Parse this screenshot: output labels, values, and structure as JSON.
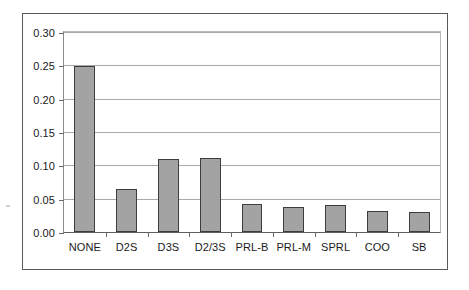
{
  "chart_data": {
    "type": "bar",
    "title": "",
    "subtitle": "",
    "xlabel": "",
    "ylabel": "",
    "categories": [
      "NONE",
      "D2S",
      "D3S",
      "D2/3S",
      "PRL-B",
      "PRL-M",
      "SPRL",
      "COO",
      "SB"
    ],
    "values": [
      0.249,
      0.065,
      0.109,
      0.111,
      0.042,
      0.037,
      0.041,
      0.032,
      0.03
    ],
    "series": [
      {
        "name": "",
        "values": [
          0.249,
          0.065,
          0.109,
          0.111,
          0.042,
          0.037,
          0.041,
          0.032,
          0.03
        ]
      }
    ],
    "ylim": [
      0.0,
      0.3
    ],
    "ytick_values": [
      0.0,
      0.05,
      0.1,
      0.15,
      0.2,
      0.25,
      0.3
    ],
    "ytick_labels": [
      "0.00",
      "0.05",
      "0.10",
      "0.15",
      "0.20",
      "0.25",
      "0.30"
    ],
    "grid": true,
    "grid_axis": "y",
    "legend": false,
    "legend_position": "none",
    "bar_fill_color": "#a3a3a3",
    "bar_edge_color": "#3d3d3d",
    "gridline_color": "#a9a9a9",
    "axis_color": "#5e5e5e",
    "frame_color": "#5a5a5a",
    "background_color": "#ffffff",
    "text_color": "#1a1a1a"
  }
}
